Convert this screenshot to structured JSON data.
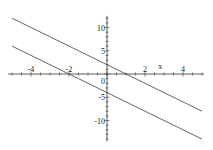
{
  "chart_data": {
    "type": "line",
    "title": "",
    "xlabel": "x",
    "ylabel": "",
    "xlim": [
      -5.2,
      5.1
    ],
    "ylim": [
      -14.5,
      12.5
    ],
    "grid": false,
    "legend": null,
    "x_ticks": [
      -4,
      -2,
      2,
      4
    ],
    "y_ticks": [
      10,
      5,
      0,
      -5,
      -10
    ],
    "x_tick_labels": [
      "-4",
      "-2",
      "2",
      "4"
    ],
    "y_tick_labels": [
      "10",
      "5",
      "0",
      "-5",
      "-10"
    ],
    "series": [
      {
        "name": "y = -2x + 2",
        "x": [
          -5,
          5
        ],
        "y": [
          12,
          -8
        ]
      },
      {
        "name": "y = -2x - 4",
        "x": [
          -5,
          5
        ],
        "y": [
          6,
          -14
        ]
      }
    ],
    "line_color": "#555555",
    "axis_color": "#333333"
  }
}
